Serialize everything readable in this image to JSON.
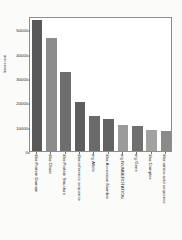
{
  "chart_data": {
    "type": "bar",
    "title": "",
    "xlabel": "",
    "ylabel": "Instance count",
    "ylim": [
      0,
      55500
    ],
    "grid": false,
    "legend": null,
    "ytick_labels": [
      "0",
      "10000",
      "20000",
      "30000",
      "40000",
      "50000"
    ],
    "ytick_values": [
      0,
      10000,
      20000,
      30000,
      40000,
      50000
    ],
    "categories": [
      "dbo:Protein Domain",
      "dbo:Chain",
      "dbo:Protein Structure",
      "dbo:reference sequence",
      "mg:Allele",
      "dbo:Accession Number",
      "mg:NUMBEROTATION",
      "mg:Gene",
      "dbo:Complex",
      "dbo:amino acid sequence"
    ],
    "values": [
      54000,
      46500,
      32500,
      20000,
      14200,
      13200,
      10600,
      10300,
      8800,
      8200
    ],
    "bar_colors": [
      "#595959",
      "#8c8c8c",
      "#6e6e6e",
      "#5e5e5e",
      "#6a6a6a",
      "#636363",
      "#9a9a9a",
      "#707070",
      "#a2a2a2",
      "#8a8a8a"
    ]
  }
}
